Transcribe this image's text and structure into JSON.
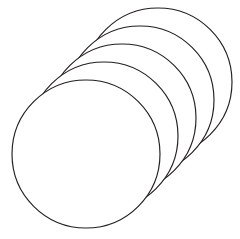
{
  "figure": {
    "title": "Stack of five overlapping circles",
    "background_color": "#ffffff",
    "stroke_color": "#231f20",
    "fill_color": "#ffffff",
    "stroke_width": 1.15,
    "canvas": {
      "width": 240,
      "height": 239
    }
  },
  "chart_data": {
    "type": "scatter",
    "title": "Stack of five overlapping circles",
    "xlabel": "",
    "ylabel": "",
    "xlim": [
      0,
      240
    ],
    "ylim": [
      0,
      239
    ],
    "grid": false,
    "legend": "none",
    "shape": "circle",
    "count": 5,
    "radius": 74,
    "offset_per_step": {
      "dx": 18,
      "dy": -18
    },
    "draw_order": "back-to-front",
    "series": [
      {
        "name": "circle-centers",
        "x": [
          158,
          140,
          122,
          104,
          86
        ],
        "y": [
          82,
          100,
          118,
          136,
          154
        ],
        "r": [
          74,
          74,
          74,
          74,
          74
        ]
      }
    ],
    "circles": [
      {
        "id": "circle-5-back",
        "label": "Circle 5 (backmost)",
        "cx": 158,
        "cy": 82,
        "r": 74,
        "z": 1
      },
      {
        "id": "circle-4",
        "label": "Circle 4",
        "cx": 140,
        "cy": 100,
        "r": 74,
        "z": 2
      },
      {
        "id": "circle-3-middle",
        "label": "Circle 3 (middle)",
        "cx": 122,
        "cy": 118,
        "r": 74,
        "z": 3
      },
      {
        "id": "circle-2",
        "label": "Circle 2",
        "cx": 104,
        "cy": 136,
        "r": 74,
        "z": 4
      },
      {
        "id": "circle-1-front",
        "label": "Circle 1 (front)",
        "cx": 86,
        "cy": 154,
        "r": 74,
        "z": 5
      }
    ]
  }
}
